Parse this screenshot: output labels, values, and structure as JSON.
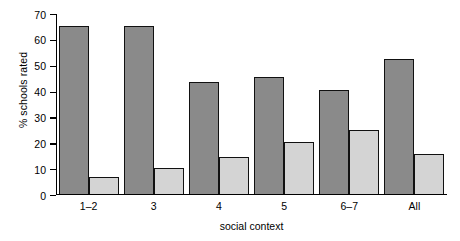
{
  "chart_data": {
    "type": "bar",
    "title": "",
    "xlabel": "social context",
    "ylabel": "% schools rated",
    "categories": [
      "1–2",
      "3",
      "4",
      "5",
      "6–7",
      "All"
    ],
    "series": [
      {
        "name": "dark-series",
        "color": "#8a8a8a",
        "values": [
          65,
          65,
          43,
          45,
          40,
          52
        ]
      },
      {
        "name": "light-series",
        "color": "#d4d4d4",
        "values": [
          6.5,
          10,
          14,
          20,
          24.5,
          15.5
        ]
      }
    ],
    "ylim": [
      0,
      70
    ],
    "ytick_labels": [
      "70",
      "60",
      "50",
      "40",
      "30",
      "20",
      "10",
      "0"
    ],
    "ytick_values": [
      70,
      60,
      50,
      40,
      30,
      20,
      10,
      0
    ],
    "grid": false,
    "legend": "none"
  }
}
